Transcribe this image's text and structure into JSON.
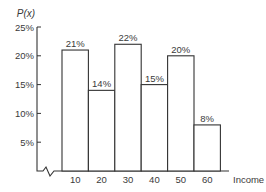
{
  "chart_data": {
    "type": "bar",
    "title": "",
    "xlabel": "Income",
    "ylabel": "P(x)",
    "categories": [
      "10",
      "20",
      "30",
      "40",
      "50",
      "60"
    ],
    "values": [
      21,
      14,
      22,
      15,
      20,
      8
    ],
    "value_labels": [
      "21%",
      "14%",
      "22%",
      "15%",
      "20%",
      "8%"
    ],
    "yticks": [
      "5%",
      "10%",
      "15%",
      "20%",
      "25%"
    ],
    "ytick_values": [
      5,
      10,
      15,
      20,
      25
    ],
    "ylim": [
      0,
      25
    ],
    "grid": false,
    "legend": null,
    "bar_style": "histogram (adjacent outlined bars, white fill)",
    "axis_break": "zigzag break symbol on x-axis near origin"
  },
  "colors": {
    "stroke": "#333333",
    "bar_fill": "#ffffff",
    "text": "#3a3a3a",
    "background": "#ffffff"
  }
}
